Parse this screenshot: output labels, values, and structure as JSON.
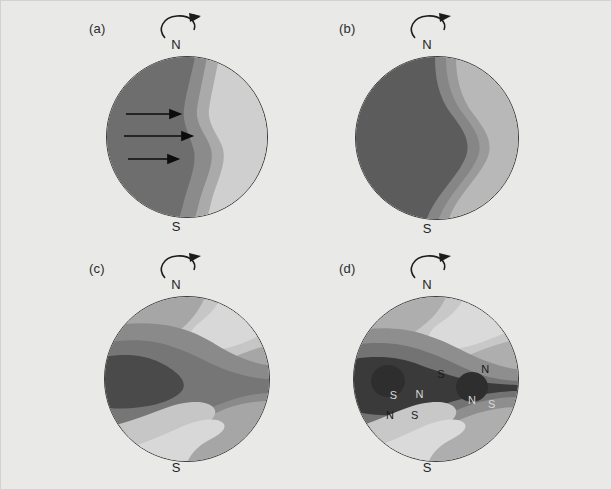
{
  "figure": {
    "background_color": "#e9e9e7",
    "border_color": "#d2d2cf",
    "panel_count": 4
  },
  "palette": {
    "band_1_darkest": "#4c4c4c",
    "band_2_dark": "#5e5e5e",
    "band_3_mid_dark": "#707070",
    "band_4_mid": "#848484",
    "band_5_mid_light": "#989898",
    "band_6_light": "#aaaaaa",
    "band_7_lighter": "#bcbcbc",
    "band_8_lightest": "#cfcfcf",
    "outline": "#3b3b3b",
    "text": "#1e1e1e"
  },
  "panels": [
    {
      "id": "a",
      "label": "(a)",
      "pole_north": "N",
      "pole_south": "S",
      "rotation_icon": "counterclockwise-rotation-arrow",
      "flow_arrows": {
        "count": 3,
        "direction": "right",
        "icon": "flow-arrow-right"
      },
      "pattern": "meridional-bands-vertical",
      "band_values": [
        1,
        2,
        3,
        4
      ]
    },
    {
      "id": "b",
      "label": "(b)",
      "pole_north": "N",
      "pole_south": "S",
      "rotation_icon": "counterclockwise-rotation-arrow",
      "flow_arrows": {
        "count": 0,
        "direction": "",
        "icon": ""
      },
      "pattern": "meridional-bands-s-curve",
      "band_values": [
        1,
        2,
        3,
        4
      ]
    },
    {
      "id": "c",
      "label": "(c)",
      "pole_north": "N",
      "pole_south": "S",
      "rotation_icon": "counterclockwise-rotation-arrow",
      "flow_arrows": {
        "count": 0,
        "direction": "",
        "icon": ""
      },
      "pattern": "zonal-bands-with-dark-lobe",
      "band_values": [
        1,
        2,
        3,
        4,
        5,
        6
      ]
    },
    {
      "id": "d",
      "label": "(d)",
      "pole_north": "N",
      "pole_south": "S",
      "rotation_icon": "counterclockwise-rotation-arrow",
      "flow_arrows": {
        "count": 0,
        "direction": "",
        "icon": ""
      },
      "pattern": "zonal-bands-with-polarity-spots",
      "band_values": [
        1,
        2,
        3,
        4,
        5,
        6
      ],
      "polarity_labels": [
        {
          "text": "S",
          "x": 53,
          "y": 47
        },
        {
          "text": "N",
          "x": 80,
          "y": 44
        },
        {
          "text": "S",
          "x": 24,
          "y": 60
        },
        {
          "text": "N",
          "x": 40,
          "y": 59
        },
        {
          "text": "N",
          "x": 22,
          "y": 72
        },
        {
          "text": "S",
          "x": 37,
          "y": 72
        },
        {
          "text": "N",
          "x": 72,
          "y": 63
        },
        {
          "text": "S",
          "x": 84,
          "y": 65
        }
      ]
    }
  ]
}
